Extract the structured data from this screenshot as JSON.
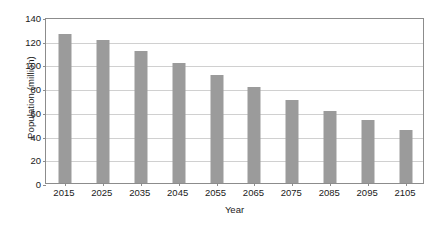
{
  "chart_data": {
    "type": "bar",
    "title": "",
    "xlabel": "Year",
    "ylabel": "Population (million)",
    "categories": [
      "2015",
      "2025",
      "2035",
      "2045",
      "2055",
      "2065",
      "2075",
      "2085",
      "2095",
      "2105"
    ],
    "values": [
      126,
      121,
      111,
      101,
      91,
      81,
      70,
      61,
      53,
      45
    ],
    "ylim": [
      0,
      140
    ],
    "yticks": [
      0,
      20,
      40,
      60,
      80,
      100,
      120,
      140
    ],
    "ytick_labels": [
      "0",
      "20",
      "40",
      "60",
      "80",
      "100",
      "120",
      "140"
    ],
    "grid": true,
    "legend": false,
    "series": [
      {
        "name": "Population",
        "values": [
          126,
          121,
          111,
          101,
          91,
          81,
          70,
          61,
          53,
          45
        ]
      }
    ],
    "colors": {
      "bar": "#9b9b9b",
      "grid": "#d0d0d0",
      "axis": "#8c8c8c",
      "text": "#1a1a1a",
      "background": "#ffffff"
    }
  }
}
